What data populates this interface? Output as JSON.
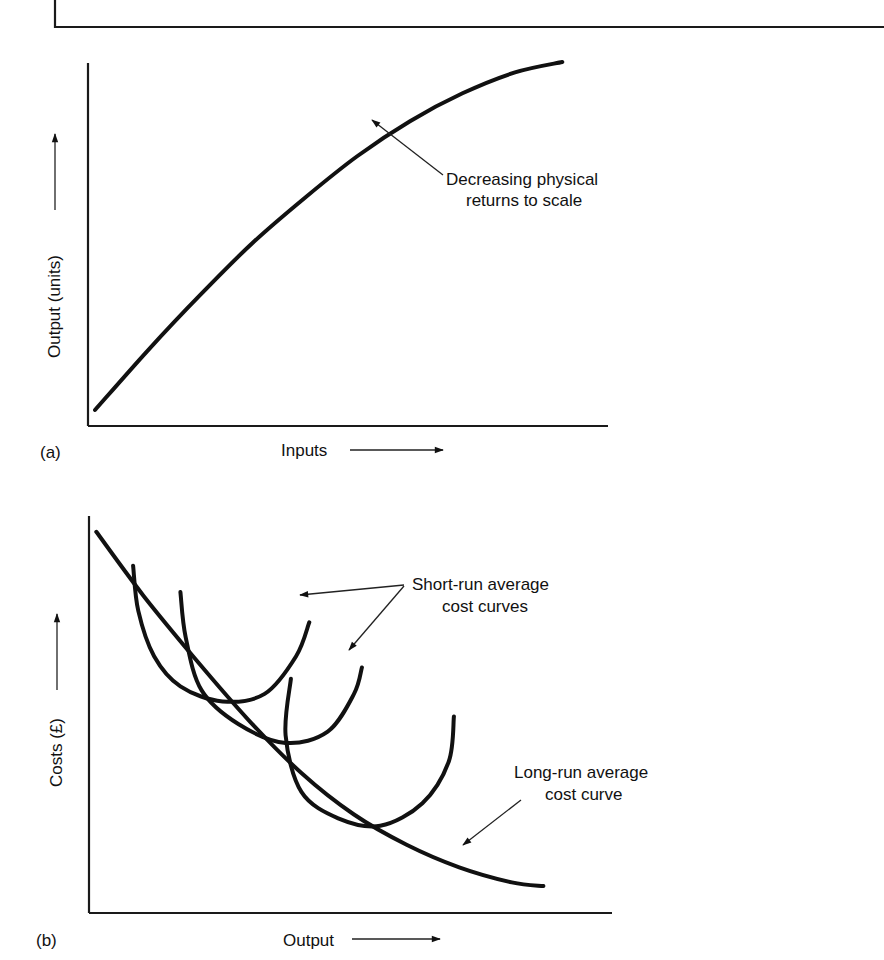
{
  "figure": {
    "top_frame": "bordered box (cropped)"
  },
  "chart_data": [
    {
      "type": "line",
      "panel": "(a)",
      "title": "",
      "xlabel": "Inputs",
      "ylabel": "Output (units)",
      "xlim": [
        0,
        100
      ],
      "ylim": [
        0,
        100
      ],
      "grid": false,
      "ticks": "none",
      "series": [
        {
          "name": "Output",
          "x": [
            0,
            10,
            20,
            30,
            40,
            50,
            60,
            70,
            80,
            89
          ],
          "y": [
            0,
            17,
            33,
            48,
            61,
            73,
            83,
            91,
            97,
            100
          ]
        }
      ],
      "annotations": [
        {
          "text": [
            "Decreasing physical",
            "returns to scale"
          ],
          "points_to_x": 53,
          "points_to_y": 76
        }
      ]
    },
    {
      "type": "line",
      "panel": "(b)",
      "title": "",
      "xlabel": "Output",
      "ylabel": "Costs (£)",
      "xlim": [
        0,
        100
      ],
      "ylim": [
        0,
        100
      ],
      "grid": false,
      "ticks": "none",
      "series": [
        {
          "name": "Long-run average cost curve",
          "x": [
            1,
            10,
            20,
            30,
            40,
            50,
            60,
            70,
            80,
            86
          ],
          "y": [
            99,
            82,
            65,
            49,
            35,
            24,
            16,
            10,
            6,
            5
          ]
        },
        {
          "name": "Short-run average cost curve 1",
          "x": [
            8,
            9,
            12,
            17,
            25,
            33,
            39,
            41.5
          ],
          "y": [
            90,
            78,
            66,
            58,
            54,
            56,
            66,
            75
          ]
        },
        {
          "name": "Short-run average cost curve 2",
          "x": [
            17,
            18,
            21,
            28,
            37,
            45,
            50,
            51.5
          ],
          "y": [
            83,
            71,
            57,
            48,
            43,
            46,
            56,
            63
          ]
        },
        {
          "name": "Short-run average cost curve 3",
          "x": [
            38,
            37,
            40,
            47,
            55,
            63,
            68,
            69
          ],
          "y": [
            60,
            45,
            30,
            23,
            21,
            27,
            38,
            50
          ]
        }
      ],
      "annotations": [
        {
          "text": [
            "Short-run average",
            "cost curves"
          ],
          "points_to": [
            "Short-run average cost curve 1",
            "Short-run average cost curve 2"
          ]
        },
        {
          "text": [
            "Long-run average",
            "cost curve"
          ],
          "points_to": [
            "Long-run average cost curve"
          ]
        }
      ]
    }
  ],
  "labels": {
    "a_panel": "(a)",
    "a_xlabel": "Inputs",
    "a_ylabel": "Output (units)",
    "a_note_1": "Decreasing physical",
    "a_note_2": "returns to scale",
    "b_panel": "(b)",
    "b_xlabel": "Output",
    "b_ylabel": "Costs (£)",
    "b_srac_1": "Short-run average",
    "b_srac_2": "cost curves",
    "b_lrac_1": "Long-run average",
    "b_lrac_2": "cost curve"
  }
}
